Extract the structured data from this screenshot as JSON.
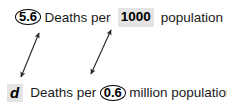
{
  "diagram": {
    "type": "cross-multiplication-rate-conversion",
    "background_color": "#ffffff",
    "text_color": "#111111",
    "highlight_color": "#e4e4e4",
    "arrow_color": "#2b2b2b",
    "rows": [
      {
        "id": "top",
        "tokens": [
          {
            "kind": "circled",
            "text": "5.6"
          },
          {
            "kind": "plain",
            "text": "Deaths per"
          },
          {
            "kind": "highlight",
            "text": "1000"
          },
          {
            "kind": "plain",
            "text": "population"
          }
        ]
      },
      {
        "id": "bottom",
        "tokens": [
          {
            "kind": "highlight-italic",
            "text": "d"
          },
          {
            "kind": "plain",
            "text": "Deaths per"
          },
          {
            "kind": "circled",
            "text": "0.6"
          },
          {
            "kind": "plain",
            "text": "million population"
          }
        ]
      }
    ],
    "arrows": [
      {
        "name": "arrow-value-to-denominator",
        "from": {
          "x": 91,
          "y": 74
        },
        "to": {
          "x": 111,
          "y": 30
        },
        "double_headed": true
      },
      {
        "name": "arrow-denominator-to-value",
        "from": {
          "x": 39,
          "y": 33
        },
        "to": {
          "x": 21,
          "y": 77
        },
        "double_headed": true
      }
    ]
  },
  "row_top": {
    "value": "5.6",
    "label_a": "Deaths per",
    "denominator": "1000",
    "label_b": "population"
  },
  "row_bottom": {
    "value": "d",
    "label_a": "Deaths per",
    "denominator": "0.6",
    "label_b": "million population"
  }
}
